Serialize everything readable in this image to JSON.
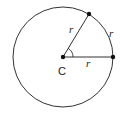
{
  "diagram": {
    "type": "circle-radian",
    "center_label": "C",
    "radius_label_1": "r",
    "radius_label_2": "r",
    "arc_label": "r",
    "colors": {
      "stroke": "#333333",
      "point": "#111111",
      "background": "#ffffff"
    }
  }
}
